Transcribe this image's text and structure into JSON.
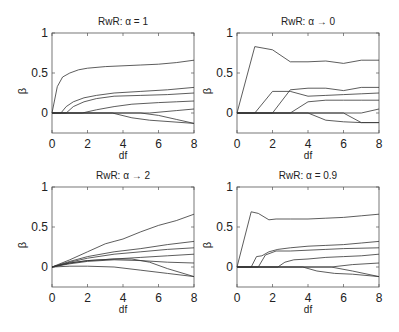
{
  "chart_data": [
    {
      "type": "line",
      "title": "RwR: α = 1",
      "xlabel": "df",
      "ylabel": "β",
      "xlim": [
        0,
        8
      ],
      "ylim": [
        -0.25,
        1
      ],
      "xticks": [
        0,
        2,
        4,
        6,
        8
      ],
      "xtick_labels": [
        "0",
        "2",
        "4",
        "6",
        "8"
      ],
      "yticks": [
        0,
        0.5,
        1
      ],
      "ytick_labels": [
        "0",
        "0.5",
        "1"
      ],
      "grid": false,
      "series": [
        {
          "name": "coef1",
          "points": [
            [
              0,
              0
            ],
            [
              0.3,
              0.33
            ],
            [
              0.6,
              0.45
            ],
            [
              1.0,
              0.5
            ],
            [
              1.5,
              0.54
            ],
            [
              2,
              0.56
            ],
            [
              3,
              0.58
            ],
            [
              4,
              0.59
            ],
            [
              5,
              0.6
            ],
            [
              6,
              0.61
            ],
            [
              7,
              0.63
            ],
            [
              8,
              0.66
            ]
          ]
        },
        {
          "name": "coef2",
          "points": [
            [
              0,
              0
            ],
            [
              0.5,
              0
            ],
            [
              0.8,
              0.08
            ],
            [
              1.2,
              0.14
            ],
            [
              1.8,
              0.19
            ],
            [
              2.5,
              0.22
            ],
            [
              3.5,
              0.25
            ],
            [
              5,
              0.27
            ],
            [
              6.5,
              0.29
            ],
            [
              8,
              0.32
            ]
          ]
        },
        {
          "name": "coef3",
          "points": [
            [
              0,
              0
            ],
            [
              0.8,
              0
            ],
            [
              1.2,
              0.08
            ],
            [
              1.8,
              0.14
            ],
            [
              2.5,
              0.18
            ],
            [
              3.5,
              0.21
            ],
            [
              5,
              0.22
            ],
            [
              6.5,
              0.23
            ],
            [
              8,
              0.25
            ]
          ]
        },
        {
          "name": "coef4",
          "points": [
            [
              0,
              0
            ],
            [
              1.7,
              0
            ],
            [
              2.5,
              0.04
            ],
            [
              3.5,
              0.08
            ],
            [
              4.5,
              0.11
            ],
            [
              6,
              0.13
            ],
            [
              7,
              0.14
            ],
            [
              8,
              0.15
            ]
          ]
        },
        {
          "name": "coef5",
          "points": [
            [
              0,
              0
            ],
            [
              5.5,
              0
            ],
            [
              7,
              0.03
            ],
            [
              8,
              0.05
            ]
          ]
        },
        {
          "name": "coef6",
          "points": [
            [
              0,
              0
            ],
            [
              3.4,
              0
            ],
            [
              4.5,
              -0.06
            ],
            [
              5.5,
              -0.09
            ],
            [
              8,
              -0.13
            ]
          ]
        },
        {
          "name": "coef7",
          "points": [
            [
              0,
              0
            ],
            [
              4,
              0
            ],
            [
              5,
              0
            ],
            [
              6,
              -0.03
            ],
            [
              7,
              -0.08
            ],
            [
              8,
              -0.13
            ]
          ]
        }
      ]
    },
    {
      "type": "line",
      "title": "RwR: α → 0",
      "xlabel": "df",
      "ylabel": "β",
      "xlim": [
        0,
        8
      ],
      "ylim": [
        -0.25,
        1
      ],
      "xticks": [
        0,
        2,
        4,
        6,
        8
      ],
      "xtick_labels": [
        "0",
        "2",
        "4",
        "6",
        "8"
      ],
      "yticks": [
        0,
        0.5,
        1
      ],
      "ytick_labels": [
        "0",
        "0.5",
        "1"
      ],
      "grid": false,
      "series": [
        {
          "name": "coef1",
          "points": [
            [
              0,
              0
            ],
            [
              1,
              0.83
            ],
            [
              2,
              0.79
            ],
            [
              3,
              0.64
            ],
            [
              4,
              0.64
            ],
            [
              5,
              0.65
            ],
            [
              6,
              0.62
            ],
            [
              7,
              0.66
            ],
            [
              8,
              0.66
            ]
          ]
        },
        {
          "name": "coef2",
          "points": [
            [
              0,
              0
            ],
            [
              1,
              0
            ],
            [
              2,
              0.27
            ],
            [
              3,
              0.27
            ],
            [
              4,
              0.21
            ],
            [
              5,
              0.22
            ],
            [
              6,
              0.23
            ],
            [
              7,
              0.24
            ],
            [
              8,
              0.25
            ]
          ]
        },
        {
          "name": "coef3",
          "points": [
            [
              0,
              0
            ],
            [
              2,
              0
            ],
            [
              3,
              0.29
            ],
            [
              4,
              0.31
            ],
            [
              5,
              0.31
            ],
            [
              6,
              0.28
            ],
            [
              7,
              0.32
            ],
            [
              8,
              0.32
            ]
          ]
        },
        {
          "name": "coef4",
          "points": [
            [
              0,
              0
            ],
            [
              3,
              0
            ],
            [
              4,
              0.14
            ],
            [
              5,
              0.16
            ],
            [
              6,
              0.16
            ],
            [
              7,
              0.16
            ],
            [
              8,
              0.16
            ]
          ]
        },
        {
          "name": "coef5",
          "points": [
            [
              0,
              0
            ],
            [
              7,
              0
            ],
            [
              8,
              0.05
            ]
          ]
        },
        {
          "name": "coef6",
          "points": [
            [
              0,
              0
            ],
            [
              4,
              0
            ],
            [
              5,
              -0.09
            ],
            [
              6,
              -0.11
            ],
            [
              7,
              -0.12
            ],
            [
              8,
              -0.12
            ]
          ]
        },
        {
          "name": "coef7",
          "points": [
            [
              0,
              0
            ],
            [
              6,
              0
            ],
            [
              7,
              -0.12
            ],
            [
              8,
              -0.12
            ]
          ]
        }
      ]
    },
    {
      "type": "line",
      "title": "RwR: α → 2",
      "xlabel": "df",
      "ylabel": "β",
      "xlim": [
        0,
        8
      ],
      "ylim": [
        -0.25,
        1
      ],
      "xticks": [
        0,
        2,
        4,
        6,
        8
      ],
      "xtick_labels": [
        "0",
        "2",
        "4",
        "6",
        "8"
      ],
      "yticks": [
        0,
        0.5,
        1
      ],
      "ytick_labels": [
        "0",
        "0.5",
        "1"
      ],
      "grid": false,
      "series": [
        {
          "name": "coef1",
          "points": [
            [
              0,
              0
            ],
            [
              1,
              0.09
            ],
            [
              2,
              0.19
            ],
            [
              3,
              0.29
            ],
            [
              3.5,
              0.32
            ],
            [
              4,
              0.35
            ],
            [
              5,
              0.44
            ],
            [
              6,
              0.52
            ],
            [
              7,
              0.58
            ],
            [
              8,
              0.66
            ]
          ]
        },
        {
          "name": "coef2",
          "points": [
            [
              0,
              0
            ],
            [
              1,
              0.07
            ],
            [
              2,
              0.13
            ],
            [
              3.5,
              0.19
            ],
            [
              5,
              0.23
            ],
            [
              6.5,
              0.28
            ],
            [
              8,
              0.32
            ]
          ]
        },
        {
          "name": "coef3",
          "points": [
            [
              0,
              0
            ],
            [
              1,
              0.06
            ],
            [
              2,
              0.11
            ],
            [
              3.5,
              0.16
            ],
            [
              5,
              0.19
            ],
            [
              6.5,
              0.22
            ],
            [
              8,
              0.24
            ]
          ]
        },
        {
          "name": "coef4",
          "points": [
            [
              0,
              0
            ],
            [
              1,
              0.05
            ],
            [
              2,
              0.08
            ],
            [
              3.5,
              0.1
            ],
            [
              5,
              0.12
            ],
            [
              6.5,
              0.14
            ],
            [
              8,
              0.16
            ]
          ]
        },
        {
          "name": "coef5",
          "points": [
            [
              0,
              0
            ],
            [
              1,
              0.04
            ],
            [
              2,
              0.07
            ],
            [
              3.5,
              0.09
            ],
            [
              5,
              0.08
            ],
            [
              6.5,
              0.06
            ],
            [
              8,
              0.05
            ]
          ]
        },
        {
          "name": "coef6",
          "points": [
            [
              0,
              0
            ],
            [
              1,
              0.05
            ],
            [
              2,
              0.08
            ],
            [
              3.5,
              0.1
            ],
            [
              4.5,
              0.1
            ],
            [
              5.5,
              0.06
            ],
            [
              6.5,
              -0.02
            ],
            [
              8,
              -0.12
            ]
          ]
        },
        {
          "name": "coef7",
          "points": [
            [
              0,
              0
            ],
            [
              1,
              0.01
            ],
            [
              2,
              0.01
            ],
            [
              3.5,
              0
            ],
            [
              5,
              -0.04
            ],
            [
              6.5,
              -0.08
            ],
            [
              8,
              -0.12
            ]
          ]
        }
      ]
    },
    {
      "type": "line",
      "title": "RwR: α = 0.9",
      "xlabel": "df",
      "ylabel": "β",
      "xlim": [
        0,
        8
      ],
      "ylim": [
        -0.25,
        1
      ],
      "xticks": [
        0,
        2,
        4,
        6,
        8
      ],
      "xtick_labels": [
        "0",
        "2",
        "4",
        "6",
        "8"
      ],
      "yticks": [
        0,
        0.5,
        1
      ],
      "ytick_labels": [
        "0",
        "0.5",
        "1"
      ],
      "grid": false,
      "series": [
        {
          "name": "coef1",
          "points": [
            [
              0,
              0
            ],
            [
              0.8,
              0.69
            ],
            [
              1.2,
              0.67
            ],
            [
              1.8,
              0.59
            ],
            [
              2.2,
              0.6
            ],
            [
              3,
              0.6
            ],
            [
              4,
              0.6
            ],
            [
              5,
              0.61
            ],
            [
              6,
              0.62
            ],
            [
              7,
              0.64
            ],
            [
              8,
              0.66
            ]
          ]
        },
        {
          "name": "coef2",
          "points": [
            [
              0,
              0
            ],
            [
              0.8,
              0
            ],
            [
              1.1,
              0.13
            ],
            [
              1.4,
              0.14
            ],
            [
              1.8,
              0.19
            ],
            [
              2.3,
              0.22
            ],
            [
              3,
              0.24
            ],
            [
              4,
              0.26
            ],
            [
              5,
              0.27
            ],
            [
              6,
              0.28
            ],
            [
              7,
              0.3
            ],
            [
              8,
              0.32
            ]
          ]
        },
        {
          "name": "coef3",
          "points": [
            [
              0,
              0
            ],
            [
              1.2,
              0
            ],
            [
              1.6,
              0.15
            ],
            [
              2.2,
              0.2
            ],
            [
              3,
              0.2
            ],
            [
              4,
              0.21
            ],
            [
              5,
              0.22
            ],
            [
              6,
              0.23
            ],
            [
              8,
              0.24
            ]
          ]
        },
        {
          "name": "coef4",
          "points": [
            [
              0,
              0
            ],
            [
              2.3,
              0
            ],
            [
              2.7,
              0.06
            ],
            [
              3.2,
              0.09
            ],
            [
              4,
              0.1
            ],
            [
              5,
              0.12
            ],
            [
              6,
              0.13
            ],
            [
              7,
              0.14
            ],
            [
              8,
              0.16
            ]
          ]
        },
        {
          "name": "coef5",
          "points": [
            [
              0,
              0
            ],
            [
              5.3,
              0
            ],
            [
              6.5,
              0.03
            ],
            [
              8,
              0.05
            ]
          ]
        },
        {
          "name": "coef6",
          "points": [
            [
              0,
              0
            ],
            [
              3.7,
              0
            ],
            [
              4.5,
              -0.05
            ],
            [
              5.5,
              -0.08
            ],
            [
              6.5,
              -0.09
            ],
            [
              8,
              -0.12
            ]
          ]
        },
        {
          "name": "coef7",
          "points": [
            [
              0,
              0
            ],
            [
              5.3,
              0
            ],
            [
              6.5,
              -0.05
            ],
            [
              8,
              -0.12
            ]
          ]
        }
      ]
    }
  ],
  "layout": {
    "panels": [
      {
        "x": 52,
        "y": 33
      },
      {
        "x": 237,
        "y": 33
      },
      {
        "x": 52,
        "y": 187
      },
      {
        "x": 237,
        "y": 187
      }
    ],
    "panel_width": 142,
    "panel_height": 100,
    "line_color": "#333333",
    "axis_color": "#555555"
  }
}
